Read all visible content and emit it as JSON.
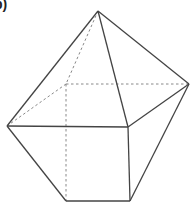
{
  "figure": {
    "label": "b)",
    "stroke_color": "#444444",
    "hidden_stroke_color": "#888888",
    "vertices": {
      "apex": [
        98,
        11
      ],
      "left": [
        7,
        126
      ],
      "right": [
        189,
        84
      ],
      "front_top": [
        128,
        127
      ],
      "hidden_top": [
        66,
        84
      ],
      "bottom_left": [
        66,
        201
      ],
      "bottom_right": [
        130,
        201
      ]
    },
    "visible_edges": [
      [
        "apex",
        "left"
      ],
      [
        "apex",
        "right"
      ],
      [
        "apex",
        "front_top"
      ],
      [
        "left",
        "front_top"
      ],
      [
        "right",
        "front_top"
      ],
      [
        "left",
        "bottom_left"
      ],
      [
        "bottom_left",
        "bottom_right"
      ],
      [
        "front_top",
        "bottom_right"
      ],
      [
        "right",
        "bottom_right"
      ]
    ],
    "hidden_edges": [
      [
        "apex",
        "hidden_top"
      ],
      [
        "hidden_top",
        "left"
      ],
      [
        "hidden_top",
        "right"
      ],
      [
        "hidden_top",
        "bottom_left"
      ]
    ]
  }
}
